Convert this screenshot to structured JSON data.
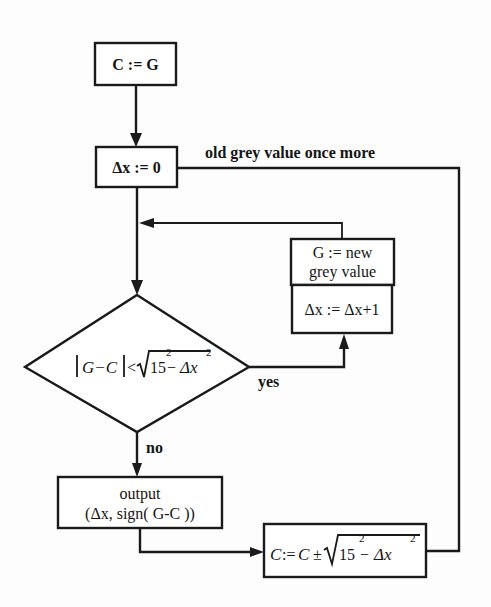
{
  "diagram": {
    "type": "flowchart",
    "nodes": {
      "init": {
        "label": "C := G"
      },
      "reset": {
        "label": "Δx := 0"
      },
      "decision": {
        "lhs": "|G−C|",
        "op": "<",
        "rhs_base": "15",
        "rhs_exp1": "2",
        "rhs_minus": "−",
        "rhs_var": "Δx",
        "rhs_exp2": "2",
        "full": "|G−C| < √(15² − Δx²)"
      },
      "new_grey": {
        "line1": "G := new",
        "line2": "grey value"
      },
      "increment": {
        "label": "Δx := Δx+1"
      },
      "output": {
        "line1": "output",
        "line2": "(Δx, sign( G-C ))"
      },
      "update": {
        "lhs": "C",
        "assign": ":=",
        "rhs_c": "C",
        "pm": "±",
        "rhs_base": "15",
        "rhs_exp1": "2",
        "rhs_minus": "−",
        "rhs_var": "Δx",
        "rhs_exp2": "2",
        "full": "C := C ± √(15² − Δx²)"
      }
    },
    "edge_labels": {
      "loop_back": "old grey value once more",
      "yes": "yes",
      "no": "no"
    },
    "edges": [
      {
        "from": "init",
        "to": "reset"
      },
      {
        "from": "reset",
        "to": "decision"
      },
      {
        "from": "decision",
        "to": "increment",
        "label": "yes"
      },
      {
        "from": "new_grey",
        "to": "decision"
      },
      {
        "from": "decision",
        "to": "output",
        "label": "no"
      },
      {
        "from": "output",
        "to": "update"
      },
      {
        "from": "update",
        "to": "reset",
        "label": "old grey value once more"
      }
    ],
    "colors": {
      "stroke": "#1a1a1a",
      "background": "#fdfdfd"
    }
  }
}
